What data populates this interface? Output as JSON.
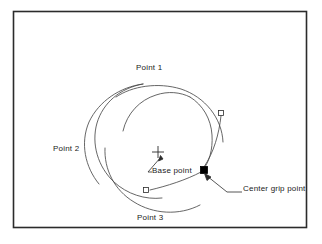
{
  "figure": {
    "name": "cad-spiral-grip-diagram",
    "frame": {
      "x": 13,
      "y": 11,
      "width": 294,
      "height": 217,
      "border_color": "#2b2b2b",
      "background": "#ffffff"
    },
    "line_color": "#4a4a4a",
    "text_color": "#1b1b1b",
    "grip_fill_selected": "#000000",
    "grip_fill_unselected": "#ffffff",
    "labels": {
      "point_1": "Point 1",
      "point_2": "Point 2",
      "point_3": "Point 3",
      "base_point": "Base point",
      "center_grip_point": "Center grip point"
    },
    "markers": {
      "base_point_marker": "plus-crosshair",
      "center_grip_marker": "filled-square-grip",
      "arc_end_grip_marker": "hollow-square-grip"
    },
    "arcs": [
      {
        "name": "arc-point-1",
        "path": "M 116 97 C 134 86 160 83 182 90 C 206 98 222 119 223 141",
        "end_grip": null
      },
      {
        "name": "arc-point-2",
        "path": "M 98 183 C 84 166 80 143 89 123 C 98 102 119 88 142 85",
        "end_grip": null
      },
      {
        "name": "arc-point-3",
        "path": "M 199 205 C 178 215 153 214 134 203 C 114 191 103 170 104 148",
        "end_grip": null
      },
      {
        "name": "arc-inner-1",
        "path": "M 174 98 C 190 106 201 120 204 136 C 208 156 200 175 185 187",
        "end_grip": {
          "x": 221,
          "y": 113
        }
      },
      {
        "name": "arc-inner-2",
        "path": "M 122 130 C 126 113 139 100 155 95",
        "end_grip": null
      },
      {
        "name": "arc-inner-3",
        "path": "M 146 190 C 131 183 120 169 117 154",
        "end_grip": {
          "x": 146,
          "y": 190
        }
      }
    ],
    "leaders": [
      {
        "name": "base-point-leader",
        "path": "M 150 173 L 161 157",
        "arrow_at": {
          "x": 162,
          "y": 155,
          "angle": -55
        }
      },
      {
        "name": "center-grip-leader",
        "path": "M 207 173 L 226 192 L 241 192",
        "arrow_at": {
          "x": 206,
          "y": 172,
          "angle": -135
        }
      }
    ],
    "grips": [
      {
        "name": "center-grip",
        "x": 204,
        "y": 170,
        "size": 6,
        "filled": true
      },
      {
        "name": "arc-grip-right",
        "x": 221,
        "y": 113,
        "size": 4,
        "filled": false
      },
      {
        "name": "arc-grip-lower",
        "x": 146,
        "y": 190,
        "size": 4,
        "filled": false
      }
    ],
    "base_point": {
      "x": 158,
      "y": 152,
      "arm": 4
    }
  }
}
